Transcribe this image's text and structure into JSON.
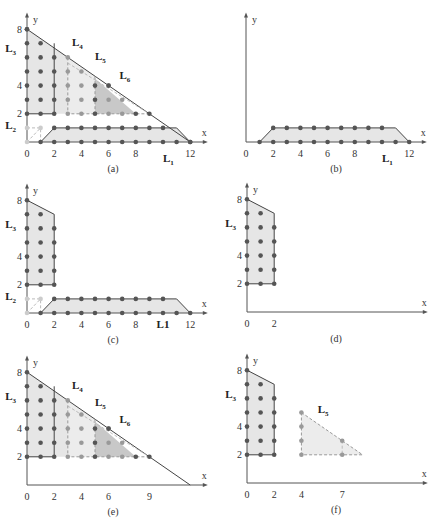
{
  "figure": {
    "panels": [
      {
        "id": "a",
        "caption": "(a)",
        "origin": [
          27,
          142
        ],
        "sx": 13.6,
        "sy": 14.1,
        "x_ticks": [
          "0",
          "2",
          "4",
          "6",
          "8",
          "12"
        ],
        "x_tick_vals": [
          0,
          2,
          4,
          6,
          8,
          12
        ],
        "y_ticks": [
          "2",
          "4",
          "8"
        ],
        "y_tick_vals": [
          2,
          4,
          8
        ],
        "labels": [
          {
            "t": "L",
            "s": "1",
            "x": 10,
            "y": -1.4
          },
          {
            "t": "L",
            "s": "2",
            "x": -1.6,
            "y": 0.9
          },
          {
            "t": "L",
            "s": "3",
            "x": -1.6,
            "y": 6.4
          },
          {
            "t": "L",
            "s": "4",
            "x": 3.3,
            "y": 6.8
          },
          {
            "t": "L",
            "s": "5",
            "x": 5.0,
            "y": 5.8
          },
          {
            "t": "L",
            "s": "6",
            "x": 6.8,
            "y": 4.5
          }
        ]
      },
      {
        "id": "b",
        "caption": "(b)",
        "origin": [
          246,
          142
        ],
        "sx": 13.6,
        "sy": 14.1,
        "x_ticks": [
          "0",
          "2",
          "4",
          "6",
          "8",
          "12"
        ],
        "x_tick_vals": [
          0,
          2,
          4,
          6,
          8,
          12
        ],
        "y_ticks": [],
        "y_tick_vals": [],
        "labels": [
          {
            "t": "L",
            "s": "1",
            "x": 10,
            "y": -1.4
          }
        ]
      },
      {
        "id": "c",
        "caption": "(c)",
        "origin": [
          27,
          313
        ],
        "sx": 13.6,
        "sy": 14.1,
        "x_ticks": [
          "0",
          "2",
          "4",
          "6",
          "8",
          "L1",
          "12"
        ],
        "x_tick_vals": [
          0,
          2,
          4,
          6,
          8,
          10,
          12
        ],
        "y_ticks": [
          "2",
          "4",
          "8"
        ],
        "y_tick_vals": [
          2,
          4,
          8
        ],
        "labels": [
          {
            "t": "L",
            "s": "2",
            "x": -1.6,
            "y": 0.9
          },
          {
            "t": "L",
            "s": "3",
            "x": -1.6,
            "y": 6.0
          }
        ]
      },
      {
        "id": "d",
        "caption": "(d)",
        "origin": [
          247,
          312
        ],
        "sx": 13.6,
        "sy": 14.1,
        "x_ticks": [
          "0",
          "2"
        ],
        "x_tick_vals": [
          0,
          2
        ],
        "y_ticks": [
          "2",
          "4",
          "8"
        ],
        "y_tick_vals": [
          2,
          4,
          8
        ],
        "labels": [
          {
            "t": "L",
            "s": "3",
            "x": -1.6,
            "y": 6.0
          }
        ]
      },
      {
        "id": "e",
        "caption": "(e)",
        "origin": [
          27,
          485
        ],
        "sx": 13.6,
        "sy": 14.1,
        "x_ticks": [
          "0",
          "2",
          "4",
          "6",
          "9"
        ],
        "x_tick_vals": [
          0,
          2,
          4,
          6,
          9
        ],
        "y_ticks": [
          "2",
          "4",
          "8"
        ],
        "y_tick_vals": [
          2,
          4,
          8
        ],
        "labels": [
          {
            "t": "L",
            "s": "3",
            "x": -1.6,
            "y": 6.0
          },
          {
            "t": "L",
            "s": "4",
            "x": 3.3,
            "y": 6.8
          },
          {
            "t": "L",
            "s": "5",
            "x": 5.0,
            "y": 5.6
          },
          {
            "t": "L",
            "s": "6",
            "x": 6.8,
            "y": 4.4
          }
        ]
      },
      {
        "id": "f",
        "caption": "(f)",
        "origin": [
          247,
          483
        ],
        "sx": 13.6,
        "sy": 14.1,
        "x_ticks": [
          "0",
          "2",
          "4",
          "7"
        ],
        "x_tick_vals": [
          0,
          2,
          4,
          7
        ],
        "y_ticks": [
          "2",
          "4",
          "8"
        ],
        "y_tick_vals": [
          2,
          4,
          8
        ],
        "labels": [
          {
            "t": "L",
            "s": "3",
            "x": -1.6,
            "y": 6.0
          },
          {
            "t": "L",
            "s": "5",
            "x": 5.2,
            "y": 5.0
          }
        ]
      }
    ],
    "axis_labels": {
      "x": "x",
      "y": "y"
    },
    "colors": {
      "dot": "#555555",
      "dot_light": "#999999",
      "fill": "#e6e6e6",
      "fill_dark": "#c8c8c8",
      "edge": "#444444"
    }
  }
}
